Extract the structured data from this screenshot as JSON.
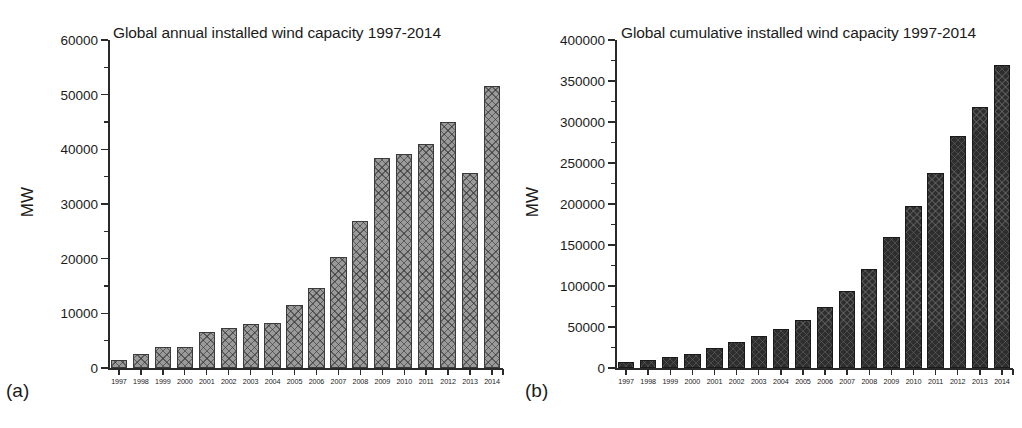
{
  "figure": {
    "panels": [
      {
        "letter": "(a)",
        "ylabel": "MW",
        "title": "Global annual installed wind capacity 1997-2014"
      },
      {
        "letter": "(b)",
        "ylabel": "MW",
        "title": "Global cumulative installed wind capacity 1997-2014"
      }
    ]
  },
  "chart_data": [
    {
      "type": "bar",
      "title": "Global annual installed wind capacity 1997-2014",
      "panel": "(a)",
      "xlabel": "",
      "ylabel": "MW",
      "ylim": [
        0,
        60000
      ],
      "ytick_labels": [
        "0",
        "10000",
        "20000",
        "30000",
        "40000",
        "50000",
        "60000"
      ],
      "yticks": [
        0,
        10000,
        20000,
        30000,
        40000,
        50000,
        60000
      ],
      "yminor_step": 5000,
      "grid": false,
      "legend": "none",
      "categories": [
        "1997",
        "1998",
        "1999",
        "2000",
        "2001",
        "2002",
        "2003",
        "2004",
        "2005",
        "2006",
        "2007",
        "2008",
        "2009",
        "2010",
        "2011",
        "2012",
        "2013",
        "2014"
      ],
      "values": [
        1530,
        2520,
        3760,
        3760,
        6500,
        7270,
        8130,
        8210,
        11530,
        14700,
        20290,
        26870,
        38470,
        39060,
        41000,
        45030,
        35760,
        51670
      ]
    },
    {
      "type": "bar",
      "title": "Global cumulative installed wind capacity 1997-2014",
      "panel": "(b)",
      "xlabel": "",
      "ylabel": "MW",
      "ylim": [
        0,
        400000
      ],
      "ytick_labels": [
        "0",
        "50000",
        "100000",
        "150000",
        "200000",
        "250000",
        "300000",
        "350000",
        "400000"
      ],
      "yticks": [
        0,
        50000,
        100000,
        150000,
        200000,
        250000,
        300000,
        350000,
        400000
      ],
      "yminor_step": 25000,
      "grid": false,
      "legend": "none",
      "categories": [
        "1997",
        "1998",
        "1999",
        "2000",
        "2001",
        "2002",
        "2003",
        "2004",
        "2005",
        "2006",
        "2007",
        "2008",
        "2009",
        "2010",
        "2011",
        "2012",
        "2013",
        "2014"
      ],
      "values": [
        7600,
        10200,
        13600,
        17400,
        23900,
        31100,
        39431,
        47620,
        59091,
        74052,
        93820,
        120291,
        159766,
        197946,
        238110,
        282850,
        318697,
        369862
      ]
    }
  ]
}
